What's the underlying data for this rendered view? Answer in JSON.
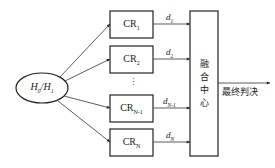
{
  "diagram": {
    "hypothesis": {
      "main": "H",
      "sub0": "0",
      "sep": "/",
      "main2": "H",
      "sub1": "1"
    },
    "radios": [
      {
        "base": "CR",
        "sub": "1",
        "decision": "d",
        "dsub": "1"
      },
      {
        "base": "CR",
        "sub": "2",
        "decision": "d",
        "dsub": "2"
      },
      {
        "base": "CR",
        "sub": "N-1",
        "decision": "d",
        "dsub": "N-1"
      },
      {
        "base": "CR",
        "sub": "N",
        "decision": "d",
        "dsub": "N"
      }
    ],
    "ellipsis": "⋮",
    "fusion_center": "融合中心",
    "fusion_chars": [
      "融",
      "合",
      "中",
      "心"
    ],
    "output_label": "最终判决"
  }
}
